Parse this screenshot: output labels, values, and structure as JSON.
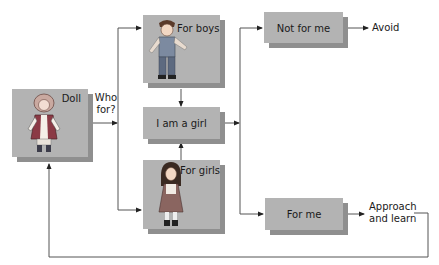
{
  "diagram": {
    "nodes": {
      "doll": {
        "label": "Doll",
        "image": "doll-illustration"
      },
      "who_for": {
        "label_line1": "Who",
        "label_line2": "for?"
      },
      "for_boys": {
        "label": "For boys",
        "image": "boy-illustration"
      },
      "i_am_a_girl": {
        "label": "I am a girl"
      },
      "for_girls": {
        "label": "For girls",
        "image": "girl-illustration"
      },
      "not_for_me": {
        "label": "Not for me"
      },
      "avoid": {
        "label": "Avoid"
      },
      "for_me": {
        "label": "For me"
      },
      "approach": {
        "label_line1": "Approach",
        "label_line2": "and learn"
      }
    },
    "edges": [
      {
        "from": "doll",
        "to": "for_boys"
      },
      {
        "from": "doll",
        "to": "for_girls"
      },
      {
        "from": "for_boys",
        "to": "i_am_a_girl"
      },
      {
        "from": "for_girls",
        "to": "i_am_a_girl"
      },
      {
        "from": "i_am_a_girl",
        "to": "not_for_me"
      },
      {
        "from": "i_am_a_girl",
        "to": "for_me"
      },
      {
        "from": "not_for_me",
        "to": "avoid"
      },
      {
        "from": "for_me",
        "to": "approach"
      },
      {
        "from": "approach",
        "to": "doll"
      }
    ],
    "colors": {
      "box": "#b3b3b3",
      "shadow": "#8f8f8f",
      "line": "#555555"
    }
  }
}
